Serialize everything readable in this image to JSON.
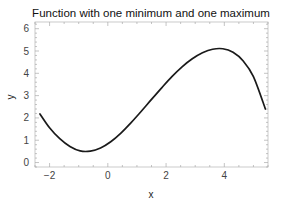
{
  "chart_data": {
    "type": "line",
    "title": "Function with one minimum and one maximum",
    "xlabel": "x",
    "ylabel": "y",
    "xlim": [
      -2.5,
      5.5
    ],
    "ylim": [
      -0.2,
      6.3
    ],
    "x_ticks": [
      -2,
      0,
      2,
      4
    ],
    "y_ticks": [
      0,
      1,
      2,
      3,
      4,
      5,
      6
    ],
    "grid": false,
    "legend": null,
    "frame": true,
    "line_color": "#1a1a1a",
    "series": [
      {
        "name": "f(x)",
        "x": [
          -2.33,
          -2.0,
          -1.65,
          -1.3,
          -0.95,
          -0.6,
          -0.25,
          0.1,
          0.45,
          0.8,
          1.15,
          1.5,
          1.85,
          2.2,
          2.55,
          2.9,
          3.25,
          3.6,
          3.95,
          4.3,
          4.65,
          5.0,
          5.41
        ],
        "y": [
          2.18,
          1.56,
          1.07,
          0.72,
          0.52,
          0.51,
          0.65,
          0.93,
          1.32,
          1.79,
          2.3,
          2.83,
          3.35,
          3.85,
          4.29,
          4.65,
          4.92,
          5.08,
          5.1,
          4.94,
          4.55,
          3.85,
          2.4
        ]
      }
    ],
    "annotations": {
      "minimum": {
        "x": -0.8,
        "y": 0.5
      },
      "maximum": {
        "x": 3.75,
        "y": 5.12
      }
    }
  }
}
